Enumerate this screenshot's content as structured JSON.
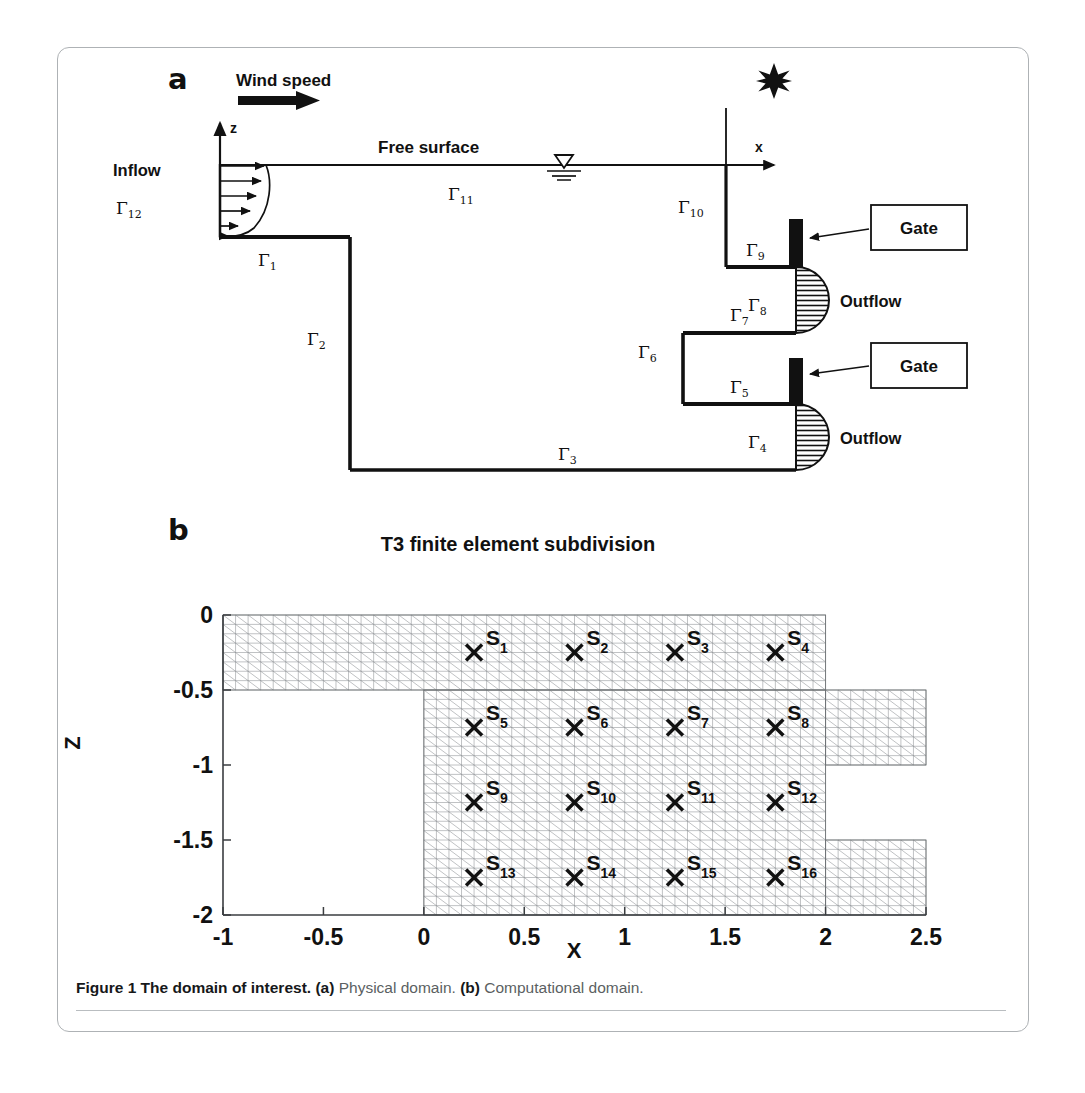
{
  "figure": {
    "caption_lead": "Figure 1 The domain of interest.",
    "caption_a_tag": "(a)",
    "caption_a_text": " Physical domain. ",
    "caption_b_tag": "(b)",
    "caption_b_text": " Computational domain."
  },
  "panel_a": {
    "letter": "a",
    "wind_label": "Wind speed",
    "inflow_label": "Inflow",
    "free_surface_label": "Free surface",
    "axis_z_label": "z",
    "axis_x_label": "x",
    "gate_label_top": "Gate",
    "gate_label_bottom": "Gate",
    "outflow_label_top": "Outflow",
    "outflow_label_bottom": "Outflow",
    "sun_icon": "sun-star-icon",
    "water_level_icon": "water-level-triangle-icon",
    "boundaries": [
      {
        "id": "G1",
        "symbol": "Γ",
        "sub": "1"
      },
      {
        "id": "G2",
        "symbol": "Γ",
        "sub": "2"
      },
      {
        "id": "G3",
        "symbol": "Γ",
        "sub": "3"
      },
      {
        "id": "G4",
        "symbol": "Γ",
        "sub": "4"
      },
      {
        "id": "G5",
        "symbol": "Γ",
        "sub": "5"
      },
      {
        "id": "G6",
        "symbol": "Γ",
        "sub": "6"
      },
      {
        "id": "G7",
        "symbol": "Γ",
        "sub": "7"
      },
      {
        "id": "G8",
        "symbol": "Γ",
        "sub": "8"
      },
      {
        "id": "G9",
        "symbol": "Γ",
        "sub": "9"
      },
      {
        "id": "G10",
        "symbol": "Γ",
        "sub": "10"
      },
      {
        "id": "G11",
        "symbol": "Γ",
        "sub": "11"
      },
      {
        "id": "G12",
        "symbol": "Γ",
        "sub": "12"
      }
    ]
  },
  "panel_b": {
    "letter": "b"
  },
  "chart_data": {
    "type": "mesh",
    "title": "T3 finite element subdivision",
    "xlabel": "X",
    "ylabel": "Z",
    "xlim": [
      -1,
      2.5
    ],
    "ylim": [
      -2,
      0
    ],
    "xticks": [
      -1,
      -0.5,
      0,
      0.5,
      1,
      1.5,
      2,
      2.5
    ],
    "xticklabels": [
      "-1",
      "-0.5",
      "0",
      "0.5",
      "1",
      "1.5",
      "2",
      "2.5"
    ],
    "yticks": [
      0,
      -0.5,
      -1,
      -1.5,
      -2
    ],
    "yticklabels": [
      "0",
      "-0.5",
      "-1",
      "-1.5",
      "-2"
    ],
    "grid": false,
    "element_type": "T3 (linear triangle)",
    "element_size": 0.0625,
    "meshed_regions": [
      {
        "name": "upper-channel",
        "x0": -1.0,
        "x1": 2.0,
        "z0": -0.5,
        "z1": 0.0
      },
      {
        "name": "main-basin",
        "x0": 0.0,
        "x1": 2.0,
        "z0": -2.0,
        "z1": -0.5
      },
      {
        "name": "upper-outlet",
        "x0": 2.0,
        "x1": 2.5,
        "z0": -1.0,
        "z1": -0.5
      },
      {
        "name": "lower-outlet",
        "x0": 2.0,
        "x1": 2.5,
        "z0": -2.0,
        "z1": -1.5
      }
    ],
    "void_regions": [
      {
        "name": "left-void",
        "x0": -1.0,
        "x1": 0.0,
        "z0": -2.0,
        "z1": -0.5
      },
      {
        "name": "upper-right-void",
        "x0": 2.0,
        "x1": 2.5,
        "z0": -0.5,
        "z1": 0.0
      },
      {
        "name": "mid-right-void",
        "x0": 2.0,
        "x1": 2.5,
        "z0": -1.5,
        "z1": -1.0
      }
    ],
    "sample_points": [
      {
        "label": "S",
        "sub": "1",
        "x": 0.25,
        "z": -0.25
      },
      {
        "label": "S",
        "sub": "2",
        "x": 0.75,
        "z": -0.25
      },
      {
        "label": "S",
        "sub": "3",
        "x": 1.25,
        "z": -0.25
      },
      {
        "label": "S",
        "sub": "4",
        "x": 1.75,
        "z": -0.25
      },
      {
        "label": "S",
        "sub": "5",
        "x": 0.25,
        "z": -0.75
      },
      {
        "label": "S",
        "sub": "6",
        "x": 0.75,
        "z": -0.75
      },
      {
        "label": "S",
        "sub": "7",
        "x": 1.25,
        "z": -0.75
      },
      {
        "label": "S",
        "sub": "8",
        "x": 1.75,
        "z": -0.75
      },
      {
        "label": "S",
        "sub": "9",
        "x": 0.25,
        "z": -1.25
      },
      {
        "label": "S",
        "sub": "10",
        "x": 0.75,
        "z": -1.25
      },
      {
        "label": "S",
        "sub": "11",
        "x": 1.25,
        "z": -1.25
      },
      {
        "label": "S",
        "sub": "12",
        "x": 1.75,
        "z": -1.25
      },
      {
        "label": "S",
        "sub": "13",
        "x": 0.25,
        "z": -1.75
      },
      {
        "label": "S",
        "sub": "14",
        "x": 0.75,
        "z": -1.75
      },
      {
        "label": "S",
        "sub": "15",
        "x": 1.25,
        "z": -1.75
      },
      {
        "label": "S",
        "sub": "16",
        "x": 1.75,
        "z": -1.75
      }
    ],
    "marker": "x-cross"
  },
  "colors": {
    "ink": "#111111",
    "mesh_line": "#8b8f93",
    "card_border": "#aeb2b5",
    "caption_body": "#5b5f62"
  }
}
